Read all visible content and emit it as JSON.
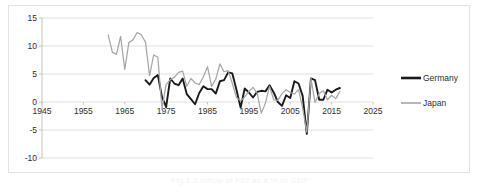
{
  "figure": {
    "caption": "Fig 1.2 Inflow of FDI as a % of GDP"
  },
  "chart_data": {
    "type": "line",
    "title": "",
    "xlabel": "",
    "ylabel": "",
    "xlim": [
      1945,
      2025
    ],
    "ylim": [
      -10,
      15
    ],
    "xticks": [
      1945,
      1955,
      1965,
      1975,
      1985,
      1995,
      2005,
      2015,
      2025
    ],
    "yticks": [
      -10,
      -5,
      0,
      5,
      10,
      15
    ],
    "grid": "horizontal",
    "legend_position": "right",
    "axis_label_position": "zero-crossing",
    "colors": {
      "germany": "#1a1a1a",
      "japan": "#a6a6a6",
      "gridline": "#d9d9d9",
      "axis": "#bfbfbf",
      "border": "#e2e2e2",
      "text": "#2d2d2d"
    },
    "series": [
      {
        "name": "Germany",
        "color": "#1a1a1a",
        "x": [
          1970,
          1971,
          1972,
          1973,
          1974,
          1975,
          1976,
          1977,
          1978,
          1979,
          1980,
          1981,
          1982,
          1983,
          1984,
          1985,
          1986,
          1987,
          1988,
          1989,
          1990,
          1991,
          1992,
          1993,
          1994,
          1995,
          1996,
          1997,
          1998,
          1999,
          2000,
          2001,
          2002,
          2003,
          2004,
          2005,
          2006,
          2007,
          2008,
          2009,
          2010,
          2011,
          2012,
          2013,
          2014,
          2015,
          2016,
          2017
        ],
        "values": [
          3.9,
          3.1,
          4.3,
          4.8,
          0.9,
          -0.9,
          4.2,
          3.3,
          3.0,
          4.2,
          1.4,
          0.5,
          -0.4,
          1.6,
          2.8,
          2.3,
          2.3,
          1.5,
          3.7,
          3.9,
          5.3,
          5.1,
          2.2,
          -1.0,
          2.4,
          1.7,
          0.8,
          1.8,
          2.0,
          1.9,
          3.0,
          1.7,
          0.0,
          -0.7,
          1.2,
          0.7,
          3.7,
          3.3,
          1.1,
          -5.7,
          4.2,
          3.9,
          0.4,
          0.4,
          2.2,
          1.7,
          2.2,
          2.5
        ]
      },
      {
        "name": "Japan",
        "color": "#a6a6a6",
        "x": [
          1961,
          1962,
          1963,
          1964,
          1965,
          1966,
          1967,
          1968,
          1969,
          1970,
          1971,
          1972,
          1973,
          1974,
          1975,
          1976,
          1977,
          1978,
          1979,
          1980,
          1981,
          1982,
          1983,
          1984,
          1985,
          1986,
          1987,
          1988,
          1989,
          1990,
          1991,
          1992,
          1993,
          1994,
          1995,
          1996,
          1997,
          1998,
          1999,
          2000,
          2001,
          2002,
          2003,
          2004,
          2005,
          2006,
          2007,
          2008,
          2009,
          2010,
          2011,
          2012,
          2013,
          2014,
          2015,
          2016,
          2017
        ],
        "values": [
          12.0,
          8.9,
          8.5,
          11.7,
          5.8,
          10.6,
          11.1,
          12.4,
          12.0,
          10.7,
          4.7,
          8.4,
          8.0,
          -1.2,
          3.1,
          4.0,
          4.4,
          5.3,
          5.5,
          2.8,
          4.2,
          3.4,
          3.1,
          4.5,
          6.3,
          2.8,
          4.1,
          6.8,
          5.4,
          5.6,
          3.3,
          0.8,
          0.2,
          0.9,
          1.9,
          2.6,
          1.6,
          -2.0,
          -0.2,
          2.8,
          0.4,
          0.3,
          1.5,
          2.2,
          1.7,
          1.4,
          2.2,
          -1.1,
          -5.4,
          4.2,
          -0.1,
          1.5,
          2.0,
          0.4,
          1.2,
          0.6,
          1.9
        ]
      }
    ]
  },
  "legend": {
    "items": [
      {
        "label": "Germany",
        "color": "#1a1a1a"
      },
      {
        "label": "Japan",
        "color": "#a6a6a6"
      }
    ]
  }
}
